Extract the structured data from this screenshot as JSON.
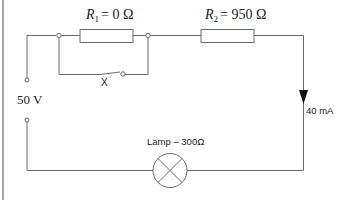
{
  "diagram": {
    "type": "circuit",
    "source": {
      "label": "50 V",
      "voltage_v": 50
    },
    "resistor_1": {
      "symbol": "R",
      "subscript": "1",
      "equals": "= 0 Ω",
      "resistance_ohm": 0
    },
    "resistor_2": {
      "symbol": "R",
      "subscript": "2",
      "equals": "= 950 Ω",
      "resistance_ohm": 950
    },
    "switch": {
      "label": "X",
      "state": "open"
    },
    "lamp": {
      "label": "Lamp – 300Ω",
      "resistance_ohm": 300
    },
    "current": {
      "label": "40 mA",
      "value_ma": 40,
      "direction": "down"
    },
    "colors": {
      "wire": "#6a6a6a",
      "text": "#222222",
      "arrow": "#111111",
      "background": "#ffffff"
    }
  }
}
